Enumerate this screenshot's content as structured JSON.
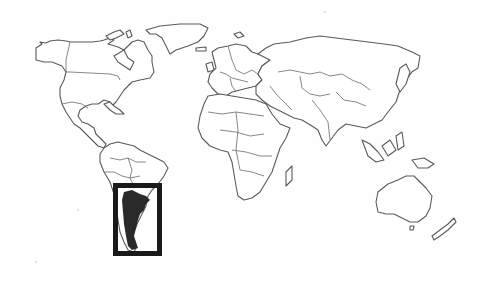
{
  "map": {
    "type": "world-outline-map",
    "style": "grayscale line drawing of country borders",
    "background_color": "#ffffff",
    "outline_color": "#5a5a5a",
    "highlight": {
      "region": "Argentina",
      "fill_color": "#2a2a2a",
      "box_color": "#1a1a1a",
      "box": {
        "x": 113,
        "y": 183,
        "width": 48,
        "height": 73
      }
    },
    "continents": [
      "North America",
      "Greenland",
      "South America",
      "Europe",
      "Africa",
      "Asia",
      "Southeast Asia",
      "Australia",
      "New Zealand"
    ]
  }
}
